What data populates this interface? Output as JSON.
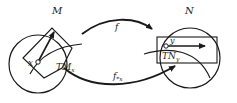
{
  "diagram": {
    "manifold_left": {
      "label": "M",
      "point_label": "x",
      "tangent_space_label": "TM",
      "tangent_space_sub": "x"
    },
    "manifold_right": {
      "label": "N",
      "point_label": "y",
      "tangent_space_label": "TN",
      "tangent_space_sub": "y"
    },
    "map_top": {
      "label": "f"
    },
    "map_bottom": {
      "label": "f",
      "label_sub": "*x"
    },
    "colors": {
      "stroke": "#1a1a1a",
      "background": "#ffffff"
    }
  }
}
